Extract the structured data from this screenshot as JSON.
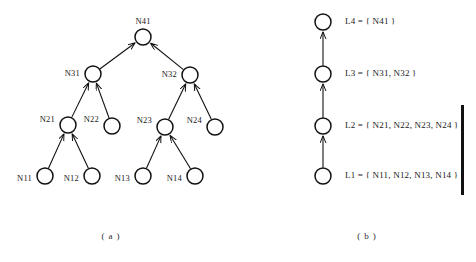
{
  "figure": {
    "colors": {
      "ink": "#111111",
      "node_fill": "#ffffff",
      "background": "#ffffff",
      "text": "#1a1a1a"
    },
    "panel_a": {
      "caption": "( a )",
      "node_radius": 8,
      "nodes": [
        {
          "id": "N41",
          "label": "N41",
          "cx": 143,
          "cy": 37,
          "label_x": 143,
          "label_y": 22,
          "label_anchor": "middle"
        },
        {
          "id": "N31",
          "label": "N31",
          "cx": 93,
          "cy": 74,
          "label_x": 80,
          "label_y": 74,
          "label_anchor": "end"
        },
        {
          "id": "N32",
          "label": "N32",
          "cx": 190,
          "cy": 75,
          "label_x": 177,
          "label_y": 75,
          "label_anchor": "end"
        },
        {
          "id": "N21",
          "label": "N21",
          "cx": 68,
          "cy": 125,
          "label_x": 55,
          "label_y": 120,
          "label_anchor": "end"
        },
        {
          "id": "N22",
          "label": "N22",
          "cx": 112,
          "cy": 126,
          "label_x": 99,
          "label_y": 120,
          "label_anchor": "end"
        },
        {
          "id": "N23",
          "label": "N23",
          "cx": 165,
          "cy": 127,
          "label_x": 152,
          "label_y": 121,
          "label_anchor": "end"
        },
        {
          "id": "N24",
          "label": "N24",
          "cx": 215,
          "cy": 127,
          "label_x": 202,
          "label_y": 121,
          "label_anchor": "end"
        },
        {
          "id": "N11",
          "label": "N11",
          "cx": 45,
          "cy": 176,
          "label_x": 32,
          "label_y": 179,
          "label_anchor": "end"
        },
        {
          "id": "N12",
          "label": "N12",
          "cx": 92,
          "cy": 176,
          "label_x": 79,
          "label_y": 179,
          "label_anchor": "end"
        },
        {
          "id": "N13",
          "label": "N13",
          "cx": 143,
          "cy": 176,
          "label_x": 130,
          "label_y": 179,
          "label_anchor": "end"
        },
        {
          "id": "N14",
          "label": "N14",
          "cx": 195,
          "cy": 176,
          "label_x": 182,
          "label_y": 179,
          "label_anchor": "end"
        }
      ],
      "edges": [
        {
          "from": "N11",
          "to": "N21"
        },
        {
          "from": "N12",
          "to": "N21"
        },
        {
          "from": "N13",
          "to": "N23"
        },
        {
          "from": "N14",
          "to": "N23"
        },
        {
          "from": "N21",
          "to": "N31"
        },
        {
          "from": "N22",
          "to": "N31"
        },
        {
          "from": "N23",
          "to": "N32"
        },
        {
          "from": "N24",
          "to": "N32"
        },
        {
          "from": "N31",
          "to": "N41"
        },
        {
          "from": "N32",
          "to": "N41"
        }
      ]
    },
    "panel_b": {
      "caption": "( b )",
      "node_radius": 8,
      "node_x": 323,
      "label_x": 345,
      "levels": [
        {
          "id": "L4",
          "text": "L4 = { N41 }",
          "cy": 22
        },
        {
          "id": "L3",
          "text": "L3 = { N31, N32 }",
          "cy": 74
        },
        {
          "id": "L2",
          "text": "L2 = { N21, N22, N23, N24 }",
          "cy": 126
        },
        {
          "id": "L1",
          "text": "L1 = { N11, N12, N13, N14 }",
          "cy": 176
        }
      ],
      "edges": [
        {
          "from": "L1",
          "to": "L2"
        },
        {
          "from": "L2",
          "to": "L3"
        },
        {
          "from": "L3",
          "to": "L4"
        }
      ],
      "margin_bar": {
        "x": 461,
        "y": 105,
        "width": 3,
        "height": 90
      }
    },
    "captions": [
      {
        "text": "( a )",
        "x": 111,
        "y": 239
      },
      {
        "text": "( b )",
        "x": 367,
        "y": 239
      }
    ]
  }
}
